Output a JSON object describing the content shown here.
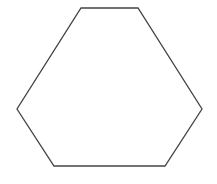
{
  "diagram": {
    "type": "polygon",
    "shape": "hexagon",
    "sides": 6,
    "background": "#ffffff",
    "fill": "none",
    "stroke": "#444444",
    "stroke_width": 1.3,
    "vertices": [
      [
        81,
        8
      ],
      [
        138,
        8
      ],
      [
        202,
        109
      ],
      [
        165,
        166
      ],
      [
        54,
        166
      ],
      [
        17,
        109
      ]
    ]
  }
}
